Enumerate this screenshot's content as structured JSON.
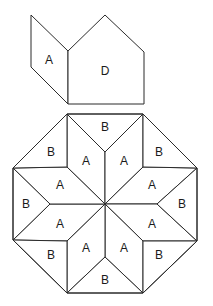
{
  "diagram": {
    "upper_shapes": [
      {
        "id": "piece-A",
        "label": "A",
        "points": "31,15 68,51 68,104 31,67",
        "label_pos": [
          49,
          60
        ]
      },
      {
        "id": "piece-D",
        "label": "D",
        "points": "68,51 105,15 144,52 144,104 68,104",
        "label_pos": [
          105,
          71
        ]
      }
    ],
    "octagon": {
      "outline": "67,114 143,114 197,168 197,241 143,293 67,293 13,240 13,168",
      "center": [
        105,
        204
      ],
      "a_rhombi": [
        {
          "label": "A",
          "points": "105,204 105,152 67,114 67,167",
          "label_pos": [
            86,
            161
          ]
        },
        {
          "label": "A",
          "points": "105,204 105,152 143,114 143,167",
          "label_pos": [
            124,
            161
          ]
        },
        {
          "label": "A",
          "points": "105,204 143,167 197,168 157,204",
          "label_pos": [
            152,
            185
          ]
        },
        {
          "label": "A",
          "points": "105,204 157,204 197,241 143,241",
          "label_pos": [
            152,
            224
          ]
        },
        {
          "label": "A",
          "points": "105,204 143,241 143,293 105,257",
          "label_pos": [
            124,
            248
          ]
        },
        {
          "label": "A",
          "points": "105,204 105,257 67,293 67,241",
          "label_pos": [
            86,
            248
          ]
        },
        {
          "label": "A",
          "points": "105,204 67,241 13,240 50,204",
          "label_pos": [
            60,
            224
          ]
        },
        {
          "label": "A",
          "points": "105,204 50,204 13,168 67,167",
          "label_pos": [
            60,
            185
          ]
        }
      ],
      "b_triangles": [
        {
          "label": "B",
          "points": "67,114 105,152 143,114",
          "label_pos": [
            105,
            127
          ]
        },
        {
          "label": "B",
          "points": "143,114 143,167 197,168",
          "label_pos": [
            159,
            152
          ]
        },
        {
          "label": "B",
          "points": "197,168 157,204 197,241",
          "label_pos": [
            182,
            204
          ]
        },
        {
          "label": "B",
          "points": "197,241 143,241 143,293",
          "label_pos": [
            159,
            255
          ]
        },
        {
          "label": "B",
          "points": "143,293 105,257 67,293",
          "label_pos": [
            105,
            280
          ]
        },
        {
          "label": "B",
          "points": "67,293 67,241 13,240",
          "label_pos": [
            51,
            255
          ]
        },
        {
          "label": "B",
          "points": "13,240 50,204 13,168",
          "label_pos": [
            26,
            204
          ]
        },
        {
          "label": "B",
          "points": "13,168 67,167 67,114",
          "label_pos": [
            51,
            152
          ]
        }
      ]
    },
    "colors": {
      "stroke": "#2b2b2b",
      "fill": "#ffffff",
      "text": "#1a1a1a"
    }
  }
}
